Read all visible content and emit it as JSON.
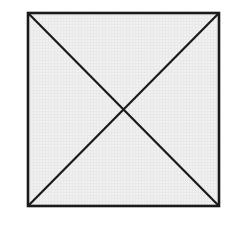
{
  "diagram": {
    "type": "square-with-diagonals",
    "square": {
      "x1": 28,
      "y1": 13,
      "x2": 219,
      "y2": 206
    },
    "diagonals": [
      {
        "from": "top-left",
        "to": "bottom-right"
      },
      {
        "from": "top-right",
        "to": "bottom-left"
      }
    ],
    "intersection": {
      "x": 124,
      "y": 109
    },
    "colors": {
      "stroke": "#1a1a1a",
      "fill": "#ededed",
      "grid": "#dcdcdc",
      "background": "#ffffff"
    },
    "stroke_width": 2.5
  }
}
